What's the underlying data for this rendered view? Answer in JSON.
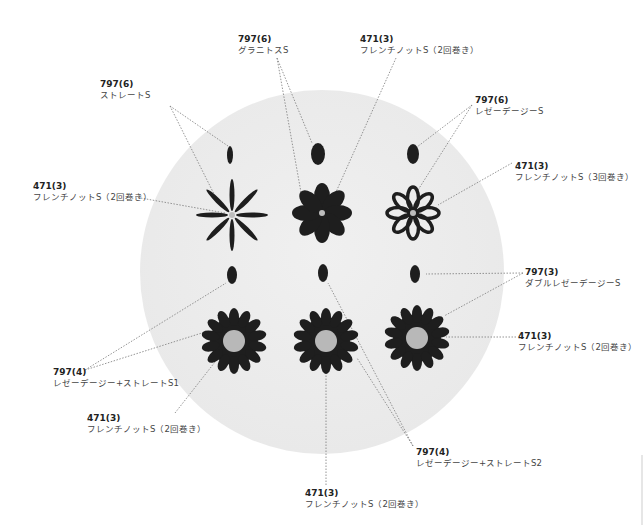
{
  "colors": {
    "fabric": "#eeeeee",
    "thread_dark": "#1e1e1e",
    "thread_light": "#bdbdbd",
    "leader": "#777777",
    "text": "#333333"
  },
  "labels": [
    {
      "id": "top-left-straight",
      "code": "797(6)",
      "name": "ストレートS",
      "x": 100,
      "y": 79
    },
    {
      "id": "top-granitos",
      "code": "797(6)",
      "name": "グラニトスS",
      "x": 238,
      "y": 34
    },
    {
      "id": "top-french-2",
      "code": "471(3)",
      "name": "フレンチノットS（2回巻き）",
      "x": 360,
      "y": 34
    },
    {
      "id": "left-french-2",
      "code": "471(3)",
      "name": "フレンチノットS（2回巻き）",
      "x": 33,
      "y": 181
    },
    {
      "id": "right-lazy-daisy",
      "code": "797(6)",
      "name": "レゼーデージーS",
      "x": 475,
      "y": 95
    },
    {
      "id": "right-french-3",
      "code": "471(3)",
      "name": "フレンチノットS（3回巻き）",
      "x": 515,
      "y": 161
    },
    {
      "id": "right-double-lazy",
      "code": "797(3)",
      "name": "ダブルレゼーデージーS",
      "x": 525,
      "y": 267
    },
    {
      "id": "right-french-2b",
      "code": "471(3)",
      "name": "フレンチノットS（2回巻き）",
      "x": 518,
      "y": 331
    },
    {
      "id": "left-lazy-straight1",
      "code": "797(4)",
      "name": "レゼーデージー+ストレートS1",
      "x": 53,
      "y": 367
    },
    {
      "id": "bottom-left-french",
      "code": "471(3)",
      "name": "フレンチノットS（2回巻き）",
      "x": 87,
      "y": 413
    },
    {
      "id": "bottom-lazy-straight2",
      "code": "797(4)",
      "name": "レゼーデージー+ストレートS2",
      "x": 416,
      "y": 447
    },
    {
      "id": "bottom-french",
      "code": "471(3)",
      "name": "フレンチノットS（2回巻き）",
      "x": 305,
      "y": 488
    }
  ]
}
